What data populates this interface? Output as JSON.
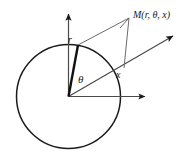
{
  "figure": {
    "type": "geometry-diagram",
    "background_color": "#ffffff",
    "stroke_color": "#1a1a1a",
    "thin_stroke_color": "#555555",
    "labels": {
      "radius": "r",
      "angle": "θ",
      "axial": "x",
      "point": "M(r, θ, x)"
    },
    "geometry": {
      "circle": {
        "cx": 68.5,
        "cy": 96.5,
        "r": 52
      },
      "origin": {
        "x": 68.5,
        "y": 96.5
      },
      "vertical_axis_tip": {
        "x": 68.5,
        "y": 10
      },
      "horizontal_axis_tip": {
        "x": 150,
        "y": 96.5
      },
      "diagonal_axis_tip": {
        "x": 178,
        "y": 33
      },
      "radius_point": {
        "x": 78,
        "y": 45
      },
      "point_m": {
        "x": 129,
        "y": 18
      },
      "foot_point": {
        "x": 124,
        "y": 68
      }
    }
  }
}
